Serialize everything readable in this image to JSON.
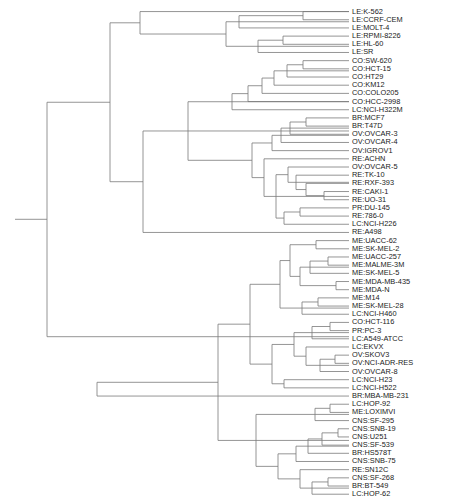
{
  "figure": {
    "type": "dendrogram",
    "orientation": "left-to-right",
    "line_color": "#7a7a7a",
    "label_color": "#1a1a1a",
    "background_color": "#ffffff",
    "width": 462,
    "height": 503
  },
  "chart_data": {
    "type": "dendrogram",
    "title": "",
    "xlabel": "",
    "ylabel": "",
    "orientation": "horizontal",
    "grid": false,
    "legend": "none",
    "n_leaves": 60,
    "leaf_labels": [
      "LE:K-562",
      "LE:CCRF-CEM",
      "LE:MOLT-4",
      "LE:RPMI-8226",
      "LE:HL-60",
      "LE:SR",
      "CO:SW-620",
      "CO:HCT-15",
      "CO:HT29",
      "CO:KM12",
      "CO:COLO205",
      "CO:HCC-2998",
      "LC:NCI-H322M",
      "BR:MCF7",
      "BR:T47D",
      "OV:OVCAR-3",
      "OV:OVCAR-4",
      "OV:IGROV1",
      "RE:ACHN",
      "OV:OVCAR-5",
      "RE:TK-10",
      "RE:RXF-393",
      "RE:CAKI-1",
      "RE:UO-31",
      "PR:DU-145",
      "RE:786-0",
      "LC:NCI-H226",
      "RE:A498",
      "ME:UACC-62",
      "ME:SK-MEL-2",
      "ME:UACC-257",
      "ME:MALME-3M",
      "ME:SK-MEL-5",
      "ME:MDA-MB-435",
      "ME:MDA-N",
      "ME:M14",
      "ME:SK-MEL-28",
      "LC:NCI-H460",
      "CO:HCT-116",
      "PR:PC-3",
      "LC:A549-ATCC",
      "LC:EKVX",
      "OV:SKOV3",
      "OV:NCI-ADR-RES",
      "OV:OVCAR-8",
      "LC:NCI-H23",
      "LC:NCI-H522",
      "BR:MBA-MB-231",
      "LC:HOP-92",
      "ME:LOXIMVI",
      "CNS:SF-295",
      "CNS:SNB-19",
      "CNS:U251",
      "CNS:SF-539",
      "BR:HS578T",
      "CNS:SNB-75",
      "RE:SN12C",
      "CNS:SF-268",
      "BR:BT-549",
      "LC:HOP-62"
    ],
    "leaf_y": [
      13.3,
      22.7,
      32.1,
      41.5,
      50.9,
      60.3,
      69.7,
      79.1,
      88.5,
      97.9,
      107.3,
      116.7,
      126.1,
      135.5,
      144.9,
      154.3,
      163.7,
      173.1,
      182.5,
      191.9,
      201.3,
      210.7,
      220.1,
      229.5,
      238.9,
      248.3,
      257.7,
      267.1,
      276.5,
      285.9,
      295.3,
      304.7,
      314.1,
      323.5,
      332.9,
      342.3,
      351.7,
      361.1,
      370.5,
      379.9,
      389.3,
      398.7,
      408.1,
      417.5,
      426.9,
      436.3,
      445.7,
      455.1,
      464.5,
      473.9,
      483.3,
      492.7,
      502.1,
      511.5,
      520.9,
      530.3,
      539.7,
      549.1,
      558.5,
      567.9
    ],
    "leaf_tip_x": [
      349,
      349,
      349,
      349,
      349,
      349,
      349,
      349,
      349,
      349,
      349,
      349,
      349,
      349,
      349,
      349,
      349,
      349,
      349,
      349,
      349,
      349,
      349,
      349,
      349,
      349,
      349,
      349,
      349,
      349,
      349,
      349,
      349,
      349,
      349,
      349,
      349,
      349,
      349,
      349,
      349,
      349,
      349,
      349,
      349,
      349,
      349,
      349,
      349,
      349,
      349,
      349,
      349,
      349,
      349,
      349,
      349,
      349,
      349,
      349
    ],
    "label_x": 352,
    "root_x": 15,
    "root_y": 252,
    "axis_shown": false,
    "note": "Hierarchical clustering dendrogram of 60 NCI-60 cancer cell lines; branch x-positions encode merge heights (smaller x = higher/earlier merge distance).",
    "nodes": [
      {
        "id": "n1",
        "x": 303,
        "children_y": [
          13.3,
          22.7
        ]
      },
      {
        "id": "n2",
        "x": 239,
        "children_y": [
          18.0,
          32.1
        ]
      },
      {
        "id": "n3",
        "x": 283,
        "children_y": [
          41.5,
          50.9
        ]
      },
      {
        "id": "n4",
        "x": 258,
        "children_y": [
          46.2,
          60.3
        ]
      },
      {
        "id": "n5",
        "x": 226,
        "children_y": [
          25.0,
          53.2
        ]
      },
      {
        "id": "n6",
        "x": 140,
        "children_y": [
          39.1,
          13.3
        ]
      },
      {
        "id": "n7",
        "x": 303,
        "children_y": [
          69.7,
          79.1
        ]
      },
      {
        "id": "n8",
        "x": 287,
        "children_y": [
          74.4,
          88.5
        ]
      },
      {
        "id": "n9",
        "x": 274,
        "children_y": [
          81.4,
          97.9
        ]
      },
      {
        "id": "n10",
        "x": 262,
        "children_y": [
          89.7,
          107.3
        ]
      },
      {
        "id": "n11",
        "x": 248,
        "children_y": [
          98.5,
          116.7
        ]
      },
      {
        "id": "n12",
        "x": 232,
        "children_y": [
          107.6,
          126.1
        ]
      },
      {
        "id": "n13",
        "x": 306,
        "children_y": [
          135.5,
          144.9
        ]
      },
      {
        "id": "n14",
        "x": 290,
        "children_y": [
          140.2,
          154.3
        ]
      },
      {
        "id": "n15",
        "x": 281,
        "children_y": [
          147.2,
          163.7
        ]
      },
      {
        "id": "n16",
        "x": 272,
        "children_y": [
          155.5,
          173.1
        ]
      },
      {
        "id": "n17",
        "x": 324,
        "children_y": [
          220.1,
          229.5
        ]
      },
      {
        "id": "n18",
        "x": 306,
        "children_y": [
          210.7,
          224.8
        ]
      },
      {
        "id": "n19",
        "x": 296,
        "children_y": [
          201.3,
          217.8
        ]
      },
      {
        "id": "n20",
        "x": 288,
        "children_y": [
          191.9,
          209.5
        ]
      },
      {
        "id": "n21",
        "x": 300,
        "children_y": [
          238.9,
          248.3
        ]
      },
      {
        "id": "n22",
        "x": 284,
        "children_y": [
          243.6,
          257.7
        ]
      },
      {
        "id": "n23",
        "x": 276,
        "children_y": [
          200.7,
          250.6
        ]
      },
      {
        "id": "n24",
        "x": 264,
        "children_y": [
          182.5,
          225.7
        ]
      },
      {
        "id": "n25",
        "x": 252,
        "children_y": [
          164.3,
          204.1
        ]
      },
      {
        "id": "n26",
        "x": 188,
        "children_y": [
          116.9,
          184.2
        ]
      },
      {
        "id": "n27",
        "x": 143,
        "children_y": [
          150.5,
          267.1
        ]
      },
      {
        "id": "n28",
        "x": 110,
        "children_y": [
          26.2,
          208.8
        ]
      },
      {
        "id": "n29",
        "x": 316,
        "children_y": [
          276.5,
          285.9
        ]
      },
      {
        "id": "n30",
        "x": 328,
        "children_y": [
          295.3,
          304.7
        ]
      },
      {
        "id": "n31",
        "x": 310,
        "children_y": [
          300.0,
          314.1
        ]
      },
      {
        "id": "n32",
        "x": 336,
        "children_y": [
          323.5,
          332.9
        ]
      },
      {
        "id": "n33",
        "x": 300,
        "children_y": [
          307.0,
          328.2
        ]
      },
      {
        "id": "n34",
        "x": 290,
        "children_y": [
          281.2,
          317.6
        ]
      },
      {
        "id": "n35",
        "x": 318,
        "children_y": [
          342.3,
          351.7
        ]
      },
      {
        "id": "n36",
        "x": 302,
        "children_y": [
          347.0,
          361.1
        ]
      },
      {
        "id": "n37",
        "x": 280,
        "children_y": [
          299.4,
          354.0
        ]
      },
      {
        "id": "n38",
        "x": 330,
        "children_y": [
          370.5,
          379.9
        ]
      },
      {
        "id": "n39",
        "x": 312,
        "children_y": [
          375.2,
          389.3
        ]
      },
      {
        "id": "n40",
        "x": 335,
        "children_y": [
          408.1,
          417.5
        ]
      },
      {
        "id": "n41",
        "x": 320,
        "children_y": [
          412.8,
          426.9
        ]
      },
      {
        "id": "n42",
        "x": 306,
        "children_y": [
          398.7,
          419.8
        ]
      },
      {
        "id": "n43",
        "x": 294,
        "children_y": [
          382.2,
          409.3
        ]
      },
      {
        "id": "n44",
        "x": 284,
        "children_y": [
          436.3,
          445.7
        ]
      },
      {
        "id": "n45",
        "x": 272,
        "children_y": [
          395.8,
          441.0
        ]
      },
      {
        "id": "n46",
        "x": 250,
        "children_y": [
          326.7,
          418.4
        ]
      },
      {
        "id": "n47",
        "x": 330,
        "children_y": [
          464.5,
          473.9
        ]
      },
      {
        "id": "n48",
        "x": 315,
        "children_y": [
          469.2,
          483.3
        ]
      },
      {
        "id": "n49",
        "x": 338,
        "children_y": [
          492.7,
          502.1
        ]
      },
      {
        "id": "n50",
        "x": 322,
        "children_y": [
          497.4,
          511.5
        ]
      },
      {
        "id": "n51",
        "x": 308,
        "children_y": [
          504.4,
          520.9
        ]
      },
      {
        "id": "n52",
        "x": 296,
        "children_y": [
          512.7,
          530.3
        ]
      },
      {
        "id": "n53",
        "x": 328,
        "children_y": [
          549.1,
          558.5
        ]
      },
      {
        "id": "n54",
        "x": 312,
        "children_y": [
          553.8,
          567.9
        ]
      },
      {
        "id": "n55",
        "x": 300,
        "children_y": [
          539.7,
          560.9
        ]
      },
      {
        "id": "n56",
        "x": 278,
        "children_y": [
          521.5,
          550.3
        ]
      },
      {
        "id": "n57",
        "x": 256,
        "children_y": [
          476.2,
          535.9
        ]
      },
      {
        "id": "n58",
        "x": 218,
        "children_y": [
          372.5,
          506.1
        ]
      },
      {
        "id": "n59",
        "x": 97,
        "children_y": [
          439.3,
          455.1
        ]
      },
      {
        "id": "n60",
        "x": 47,
        "children_y": [
          117.5,
          386.9
        ]
      }
    ]
  }
}
